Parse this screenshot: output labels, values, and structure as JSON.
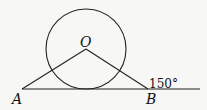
{
  "diagram": {
    "points": {
      "O": {
        "label": "O",
        "x": 86,
        "y": 49
      },
      "A": {
        "label": "A",
        "x": 22,
        "y": 89
      },
      "B": {
        "label": "B",
        "x": 148,
        "y": 89
      }
    },
    "circle": {
      "center": "O",
      "radius": 40
    },
    "line": {
      "from_x": 22,
      "to_x": 200,
      "y": 89
    },
    "angle_label": "150°",
    "colors": {
      "stroke": "#222222",
      "background": "#f7f7f5"
    }
  }
}
